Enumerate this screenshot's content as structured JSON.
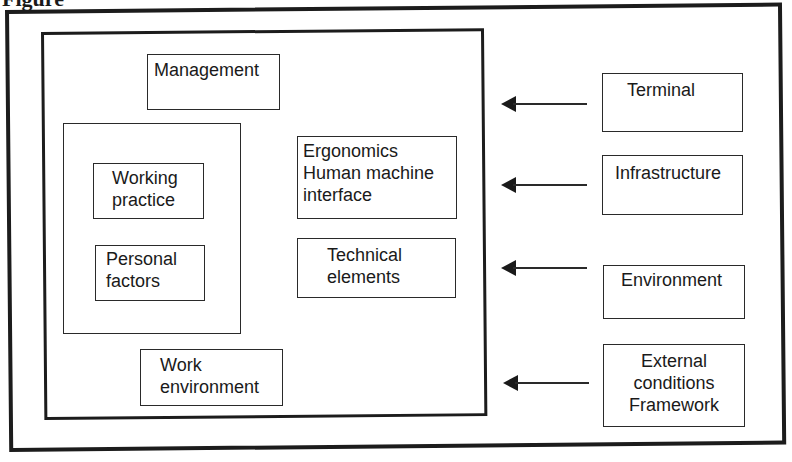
{
  "caption": "Figure",
  "diagram": {
    "inner_system": {
      "management": "Management",
      "personal_group": {
        "working_practice": "Working\npractice",
        "personal_factors": "Personal\nfactors"
      },
      "ergonomics": "Ergonomics\nHuman machine\ninterface",
      "technical_elements": "Technical\nelements",
      "work_environment": "Work\nenvironment"
    },
    "external_factors": [
      {
        "label": "Terminal"
      },
      {
        "label": "Infrastructure"
      },
      {
        "label": "Environment"
      },
      {
        "label": "External\nconditions\nFramework"
      }
    ],
    "arrows": [
      {
        "from": "Terminal",
        "direction": "left"
      },
      {
        "from": "Infrastructure",
        "direction": "left"
      },
      {
        "from": "Environment",
        "direction": "left"
      },
      {
        "from": "External conditions Framework",
        "direction": "left"
      }
    ]
  }
}
